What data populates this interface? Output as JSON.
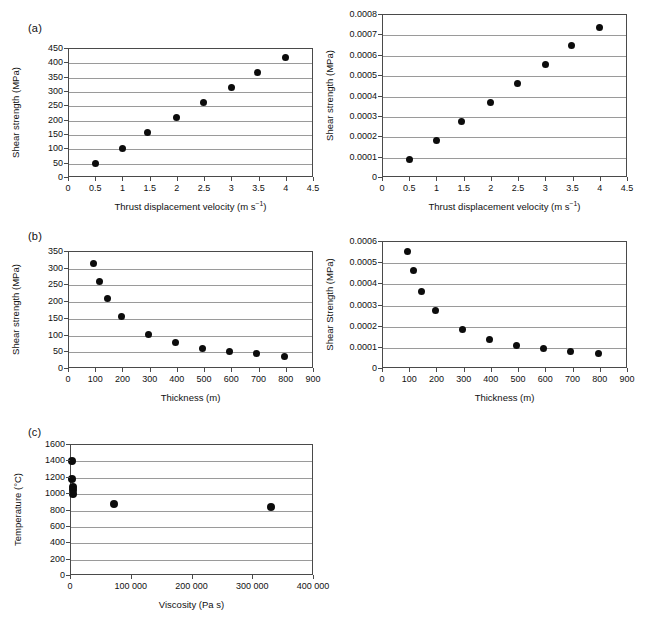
{
  "figure": {
    "background": "#ffffff",
    "marker_color": "#0c0c0c",
    "axis_color": "#4a4a4a",
    "grid_color": "#9a9a9a"
  },
  "panels": {
    "a_label": "(a)",
    "b_label": "(b)",
    "c_label": "(c)"
  },
  "chart_data": [
    {
      "id": "panel-a-left",
      "type": "scatter",
      "panel": "(a)",
      "title": "",
      "xlabel": "Thrust displacement velocity (m s−1)",
      "xlabel_base": "Thrust displacement velocity (m s",
      "xlabel_sup": "−1",
      "xlabel_tail": ")",
      "ylabel": "Shear strength (MPa)",
      "xlim": [
        0,
        4.5
      ],
      "ylim": [
        0,
        450
      ],
      "xticks": [
        0,
        0.5,
        1,
        1.5,
        2,
        2.5,
        3,
        3.5,
        4,
        4.5
      ],
      "xticklabels": [
        "0",
        "0.5",
        "1",
        "1.5",
        "2",
        "2.5",
        "3",
        "3.5",
        "4",
        "4.5"
      ],
      "yticks": [
        0,
        50,
        100,
        150,
        200,
        250,
        300,
        350,
        400,
        450
      ],
      "yticklabels": [
        "0",
        "50",
        "100",
        "150",
        "200",
        "250",
        "300",
        "350",
        "400",
        "450"
      ],
      "grid": "horizontal",
      "legend": "none",
      "x": [
        0.48,
        0.98,
        1.45,
        1.98,
        2.47,
        2.98,
        3.47,
        3.97
      ],
      "y": [
        52,
        104,
        157,
        212,
        264,
        317,
        369,
        422
      ]
    },
    {
      "id": "panel-a-right",
      "type": "scatter",
      "panel": "(a)",
      "title": "",
      "xlabel": "Thrust displacement velocity (m s−1)",
      "xlabel_base": "Thrust displacement velocity (m s",
      "xlabel_sup": "−1",
      "xlabel_tail": ")",
      "ylabel": "Shear strength (MPa)",
      "xlim": [
        0,
        4.5
      ],
      "ylim": [
        0,
        0.0008
      ],
      "xticks": [
        0,
        0.5,
        1,
        1.5,
        2,
        2.5,
        3,
        3.5,
        4,
        4.5
      ],
      "xticklabels": [
        "0",
        "0.5",
        "1",
        "1.5",
        "2",
        "2.5",
        "3",
        "3.5",
        "4",
        "4.5"
      ],
      "yticks": [
        0,
        0.0001,
        0.0002,
        0.0003,
        0.0004,
        0.0005,
        0.0006,
        0.0007,
        0.0008
      ],
      "yticklabels": [
        "0",
        "0.0001",
        "0.0002",
        "0.0003",
        "0.0004",
        "0.0005",
        "0.0006",
        "0.0007",
        "0.0008"
      ],
      "grid": "horizontal",
      "legend": "none",
      "x": [
        0.48,
        0.98,
        1.45,
        1.98,
        2.47,
        2.98,
        3.47,
        3.97
      ],
      "y": [
        8.9e-05,
        0.000185,
        0.000277,
        0.000371,
        0.000463,
        0.000558,
        0.000648,
        0.000738
      ]
    },
    {
      "id": "panel-b-left",
      "type": "scatter",
      "panel": "(b)",
      "title": "",
      "xlabel": "Thickness (m)",
      "ylabel": "Shear strength (MPa)",
      "xlim": [
        0,
        900
      ],
      "ylim": [
        0,
        350
      ],
      "xticks": [
        0,
        100,
        200,
        300,
        400,
        500,
        600,
        700,
        800,
        900
      ],
      "xticklabels": [
        "0",
        "100",
        "200",
        "300",
        "400",
        "500",
        "600",
        "700",
        "800",
        "900"
      ],
      "yticks": [
        0,
        50,
        100,
        150,
        200,
        250,
        300,
        350
      ],
      "yticklabels": [
        "0",
        "50",
        "100",
        "150",
        "200",
        "250",
        "300",
        "350"
      ],
      "grid": "horizontal",
      "legend": "none",
      "x": [
        90,
        112,
        140,
        193,
        293,
        393,
        490,
        590,
        690,
        790
      ],
      "y": [
        317,
        261,
        210,
        158,
        104,
        80,
        62,
        53,
        45,
        38
      ]
    },
    {
      "id": "panel-b-right",
      "type": "scatter",
      "panel": "(b)",
      "title": "",
      "xlabel": "Thickness (m)",
      "ylabel": "Shear Strength (MPa)",
      "xlim": [
        0,
        900
      ],
      "ylim": [
        0,
        0.0006
      ],
      "xticks": [
        0,
        100,
        200,
        300,
        400,
        500,
        600,
        700,
        800,
        900
      ],
      "xticklabels": [
        "0",
        "100",
        "200",
        "300",
        "400",
        "500",
        "600",
        "700",
        "800",
        "900"
      ],
      "yticks": [
        0,
        0.0001,
        0.0002,
        0.0003,
        0.0004,
        0.0005,
        0.0006
      ],
      "yticklabels": [
        "0",
        "0.0001",
        "0.0002",
        "0.0003",
        "0.0004",
        "0.0005",
        "0.0006"
      ],
      "grid": "horizontal",
      "legend": "none",
      "x": [
        90,
        112,
        140,
        193,
        293,
        393,
        490,
        590,
        690,
        790
      ],
      "y": [
        0.000557,
        0.000463,
        0.000367,
        0.000275,
        0.000186,
        0.00014,
        0.000112,
        9.6e-05,
        8.1e-05,
        7.2e-05
      ]
    },
    {
      "id": "panel-c",
      "type": "scatter",
      "panel": "(c)",
      "title": "",
      "xlabel": "Viscosity (Pa s)",
      "ylabel": "Temperature (°C)",
      "xlim": [
        0,
        400000
      ],
      "ylim": [
        0,
        1600
      ],
      "xticks": [
        0,
        100000,
        200000,
        300000,
        400000
      ],
      "xticklabels": [
        "0",
        "100 000",
        "200 000",
        "300 000",
        "400 000"
      ],
      "yticks": [
        0,
        200,
        400,
        600,
        800,
        1000,
        1200,
        1400,
        1600
      ],
      "yticklabels": [
        "0",
        "200",
        "400",
        "600",
        "800",
        "1000",
        "1200",
        "1400",
        "1600"
      ],
      "grid": "horizontal",
      "legend": "none",
      "x": [
        1500,
        1500,
        2500,
        3000,
        3500,
        70000,
        330000
      ],
      "y": [
        1410,
        1190,
        1090,
        1045,
        1000,
        880,
        840
      ]
    }
  ]
}
